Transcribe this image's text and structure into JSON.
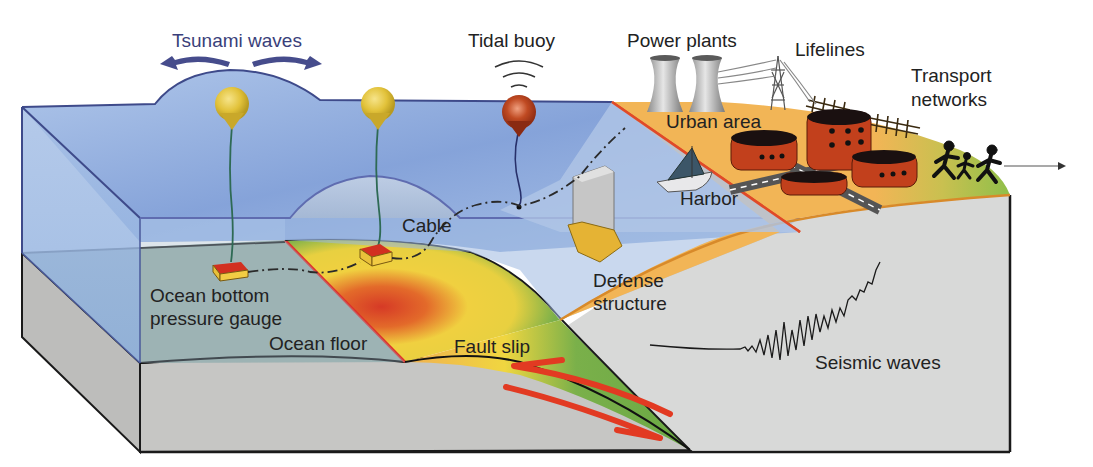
{
  "diagram": {
    "type": "illustrated cross-section"
  },
  "labels": {
    "tsunami_waves": "Tsunami waves",
    "tidal_buoy": "Tidal buoy",
    "power_plants": "Power plants",
    "lifelines": "Lifelines",
    "transport_line1": "Transport",
    "transport_line2": "networks",
    "urban_area": "Urban area",
    "harbor": "Harbor",
    "cable": "Cable",
    "defense_line1": "Defense",
    "defense_line2": "structure",
    "gauge_line1": "Ocean bottom",
    "gauge_line2": "pressure gauge",
    "ocean_floor": "Ocean floor",
    "fault_slip": "Fault slip",
    "seismic_waves": "Seismic waves"
  },
  "colors": {
    "ocean": "#8fb0de",
    "ocean_dark": "#5f7fc0",
    "ocean_edge": "#4a5a9a",
    "seafloor": "#9fb3ac",
    "crust": "#c4c4c2",
    "land_gray": "#d6d7d6",
    "urban": "#f0b554",
    "grass": "#8fbf4a",
    "slip_red": "#d9402a",
    "slip_yellow": "#f0d840",
    "slip_green": "#7ab04a",
    "buoy_yellow": "#e4c43a",
    "buoy_red": "#b9441f",
    "building": "#c2401c",
    "fault_arrow": "#e23a22",
    "wave_arrow": "#464c8c"
  }
}
